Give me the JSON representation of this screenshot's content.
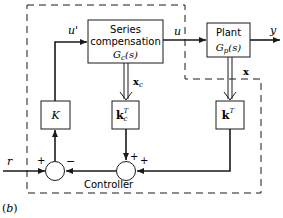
{
  "diagram": {
    "series_box": {
      "line1": "Series",
      "line2": "compensation",
      "tf_main": "G",
      "tf_sub": "c",
      "tf_arg": "(s)"
    },
    "plant_box": {
      "line1": "Plant",
      "tf_main": "G",
      "tf_sub": "p",
      "tf_arg": "(s)"
    },
    "k_box": {
      "label": "K"
    },
    "kc_box": {
      "main": "k",
      "sub": "c",
      "sup": "T"
    },
    "kt_box": {
      "main": "k",
      "sup": "T"
    },
    "signals": {
      "u_prime": "u'",
      "u": "u",
      "y": "y",
      "x": "x",
      "xc_main": "x",
      "xc_sub": "c",
      "r": "r"
    },
    "signs": {
      "sum1_left": "+",
      "sum1_right": "−",
      "sum2_top": "+",
      "sum2_right": "+"
    },
    "controller_label": "Controller",
    "figure_label": "(b)"
  },
  "colors": {
    "line": "#1a1a1a",
    "background": "#ffffff"
  }
}
